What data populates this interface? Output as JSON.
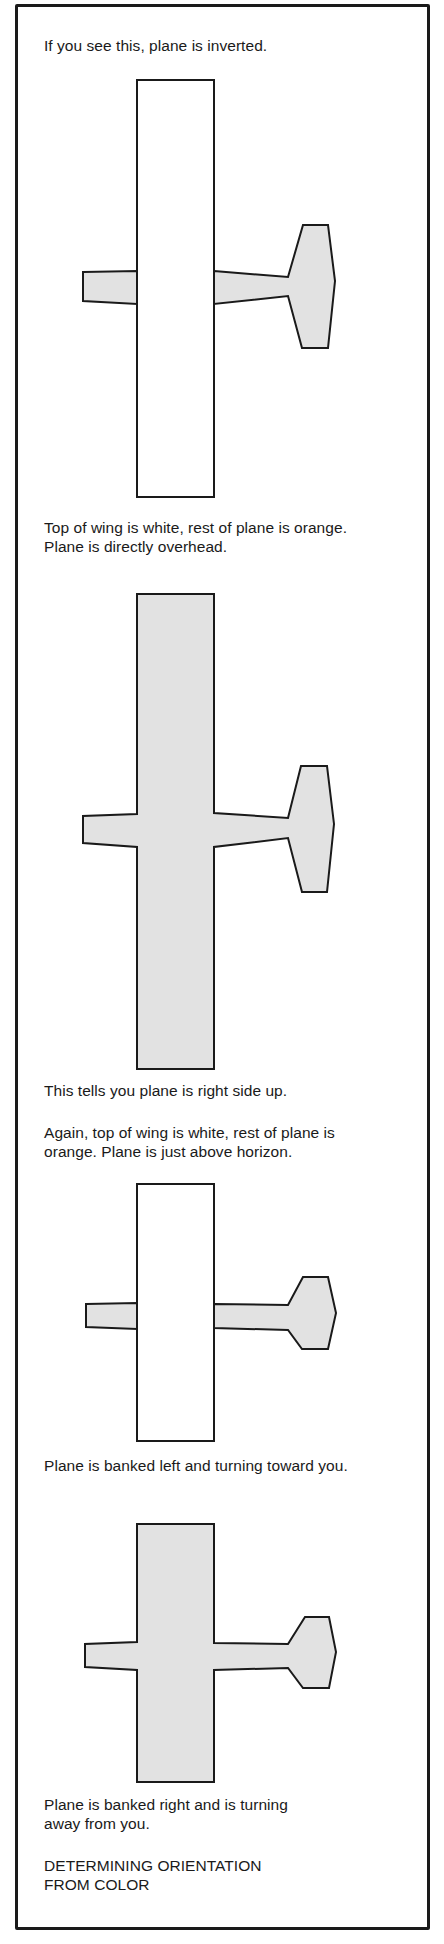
{
  "colors": {
    "orange_fill": "#e2e2e2",
    "white_fill": "#ffffff",
    "outline": "#1a1a1a"
  },
  "panels": [
    {
      "caption_above": "If you see this, plane is inverted.",
      "wing_color": "white",
      "description": "Inverted plane seen from below: white wing top not visible shape drawn white"
    },
    {
      "caption_above": "Top of wing is white, rest of plane is orange.\nPlane is directly overhead.",
      "caption_below": "This tells you plane is right side up.",
      "wing_color": "orange"
    },
    {
      "caption_above": "Again, top of wing is white, rest of plane is\norange. Plane is just above horizon.",
      "caption_below": "Plane is banked left and turning toward you.",
      "wing_color": "white"
    },
    {
      "caption_below": "Plane is banked right and is turning\naway from you.",
      "wing_color": "orange"
    }
  ],
  "figure_title": "DETERMINING ORIENTATION\nFROM COLOR"
}
